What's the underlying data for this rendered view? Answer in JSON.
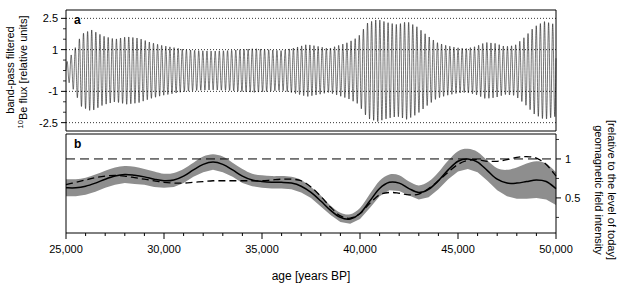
{
  "figure": {
    "width": 620,
    "height": 286,
    "background": "#ffffff",
    "band_color": "#8e8e8e",
    "line_color": "#000000"
  },
  "panel_a": {
    "label": "a",
    "axis_title_line1": "band-pass filtered",
    "axis_title_line2_pre": "10",
    "axis_title_line2": "Be flux [relative units]",
    "y_ticks": [
      "2.5",
      "1",
      "-1",
      "-2.5"
    ],
    "y_tick_values": [
      2.5,
      1,
      -1,
      -2.5
    ],
    "ylim": [
      -2.9,
      2.9
    ],
    "reference_lines": [
      2.5,
      1,
      -1,
      -2.5
    ],
    "reference_line_style": "dotted"
  },
  "panel_b": {
    "label": "b",
    "axis_title_line1": "geomagnetic field intensity",
    "axis_title_line2": "[relative to the level of today]",
    "y_ticks": [
      "1",
      "0.5"
    ],
    "y_tick_values": [
      1,
      0.5
    ],
    "ylim": [
      0.05,
      1.32
    ],
    "reference_lines": [
      1
    ],
    "reference_line_style": "dashed"
  },
  "x_axis": {
    "title": "age [years BP]",
    "tick_labels": [
      "25,000",
      "30,000",
      "35,000",
      "40,000",
      "45,000",
      "50,000"
    ],
    "tick_values": [
      25000,
      30000,
      35000,
      40000,
      45000,
      50000
    ],
    "minor_tick_step": 1000,
    "xlim": [
      25000,
      50000
    ]
  },
  "chart_data": {
    "type": "line",
    "title": "",
    "xlabel": "age [years BP]",
    "xlim": [
      25000,
      50000
    ],
    "grid": false,
    "legend": "none",
    "panels": [
      {
        "id": "a",
        "label": "a",
        "type": "line",
        "ylabel": "band-pass filtered 10Be flux [relative units]",
        "ylim": [
          -2.9,
          2.9
        ],
        "yticks": [
          2.5,
          1,
          -1,
          -2.5
        ],
        "description": "Band-pass filtered 10Be flux: high-frequency oscillation (~ 210 yr period) with amplitude modulation envelope.",
        "oscillation_period_years": 210,
        "series": [
          {
            "name": "band-pass filtered 10Be flux envelope",
            "x": [
              25000,
              25400,
              25800,
              26300,
              26900,
              27500,
              28100,
              28700,
              29300,
              29900,
              30500,
              31100,
              31800,
              32500,
              33200,
              33900,
              34600,
              35300,
              36000,
              36700,
              37300,
              37900,
              38400,
              38900,
              39400,
              39900,
              40400,
              40900,
              41400,
              41900,
              42400,
              42900,
              43400,
              43900,
              44400,
              44900,
              45400,
              45900,
              46400,
              46900,
              47400,
              47900,
              48400,
              48900,
              49400,
              50000
            ],
            "values": [
              0.35,
              0.95,
              1.75,
              1.95,
              1.65,
              1.5,
              1.62,
              1.55,
              1.35,
              1.2,
              1.1,
              1.0,
              0.95,
              0.93,
              0.95,
              1.0,
              1.05,
              1.0,
              0.95,
              1.1,
              1.25,
              1.15,
              1.05,
              1.2,
              1.35,
              1.6,
              2.3,
              2.45,
              2.3,
              2.2,
              2.35,
              2.1,
              1.7,
              1.35,
              1.2,
              1.1,
              1.05,
              1.15,
              1.35,
              1.3,
              1.15,
              1.2,
              1.6,
              2.1,
              2.35,
              2.2
            ]
          }
        ]
      },
      {
        "id": "b",
        "label": "b",
        "type": "line",
        "ylabel": "geomagnetic field intensity [relative to the level of today]",
        "ylim": [
          0.05,
          1.32
        ],
        "yticks": [
          1,
          0.5
        ],
        "reference_line": 1,
        "series": [
          {
            "name": "reconstruction (solid)",
            "style": "solid",
            "x": [
              25000,
              25500,
              26000,
              26500,
              27000,
              27500,
              28000,
              28500,
              29000,
              29500,
              30000,
              30500,
              31000,
              31500,
              32000,
              32500,
              33000,
              33500,
              34000,
              34500,
              35000,
              35500,
              36000,
              36500,
              37000,
              37500,
              38000,
              38500,
              39000,
              39500,
              40000,
              40500,
              41000,
              41500,
              42000,
              42500,
              43000,
              43500,
              44000,
              44500,
              45000,
              45500,
              46000,
              46500,
              47000,
              47500,
              48000,
              48500,
              49000,
              49500,
              50000
            ],
            "values": [
              0.63,
              0.63,
              0.65,
              0.69,
              0.74,
              0.78,
              0.8,
              0.79,
              0.77,
              0.74,
              0.72,
              0.73,
              0.78,
              0.86,
              0.93,
              0.96,
              0.93,
              0.86,
              0.78,
              0.73,
              0.71,
              0.7,
              0.7,
              0.69,
              0.65,
              0.57,
              0.46,
              0.34,
              0.25,
              0.23,
              0.3,
              0.46,
              0.62,
              0.7,
              0.69,
              0.62,
              0.57,
              0.61,
              0.72,
              0.86,
              0.97,
              1.0,
              0.96,
              0.85,
              0.74,
              0.69,
              0.69,
              0.71,
              0.73,
              0.71,
              0.62
            ]
          },
          {
            "name": "comparison record (dashed)",
            "style": "dashed",
            "x": [
              25000,
              25500,
              26000,
              26500,
              27000,
              27500,
              28000,
              28500,
              29000,
              29500,
              30000,
              30500,
              31000,
              31500,
              32000,
              32500,
              33000,
              33500,
              34000,
              34500,
              35000,
              35500,
              36000,
              36500,
              37000,
              37500,
              38000,
              38500,
              39000,
              39500,
              40000,
              40500,
              41000,
              41500,
              42000,
              42500,
              43000,
              43500,
              44000,
              44500,
              45000,
              45500,
              46000,
              46500,
              47000,
              47500,
              48000,
              48500,
              49000,
              49500,
              50000
            ],
            "values": [
              0.67,
              0.7,
              0.73,
              0.76,
              0.78,
              0.79,
              0.78,
              0.76,
              0.74,
              0.72,
              0.7,
              0.69,
              0.69,
              0.7,
              0.71,
              0.72,
              0.72,
              0.72,
              0.72,
              0.72,
              0.72,
              0.73,
              0.74,
              0.74,
              0.72,
              0.64,
              0.52,
              0.38,
              0.27,
              0.24,
              0.3,
              0.43,
              0.54,
              0.57,
              0.56,
              0.54,
              0.55,
              0.62,
              0.72,
              0.83,
              0.93,
              0.98,
              0.99,
              0.97,
              0.97,
              0.99,
              1.02,
              1.03,
              1.01,
              0.93,
              0.78
            ]
          },
          {
            "name": "uncertainty band upper",
            "style": "band",
            "x": [
              25000,
              25500,
              26000,
              26500,
              27000,
              27500,
              28000,
              28500,
              29000,
              29500,
              30000,
              30500,
              31000,
              31500,
              32000,
              32500,
              33000,
              33500,
              34000,
              34500,
              35000,
              35500,
              36000,
              36500,
              37000,
              37500,
              38000,
              38500,
              39000,
              39500,
              40000,
              40500,
              41000,
              41500,
              42000,
              42500,
              43000,
              43500,
              44000,
              44500,
              45000,
              45500,
              46000,
              46500,
              47000,
              47500,
              48000,
              48500,
              49000,
              49500,
              50000
            ],
            "values": [
              0.74,
              0.74,
              0.76,
              0.8,
              0.85,
              0.89,
              0.91,
              0.9,
              0.87,
              0.84,
              0.81,
              0.82,
              0.87,
              0.95,
              1.03,
              1.06,
              1.03,
              0.95,
              0.87,
              0.81,
              0.79,
              0.78,
              0.78,
              0.77,
              0.73,
              0.64,
              0.53,
              0.4,
              0.31,
              0.29,
              0.37,
              0.55,
              0.72,
              0.8,
              0.79,
              0.71,
              0.66,
              0.71,
              0.83,
              0.98,
              1.1,
              1.13,
              1.09,
              0.98,
              0.88,
              0.86,
              0.89,
              0.94,
              0.97,
              0.94,
              0.83
            ]
          },
          {
            "name": "uncertainty band lower",
            "style": "band",
            "x": [
              25000,
              25500,
              26000,
              26500,
              27000,
              27500,
              28000,
              28500,
              29000,
              29500,
              30000,
              30500,
              31000,
              31500,
              32000,
              32500,
              33000,
              33500,
              34000,
              34500,
              35000,
              35500,
              36000,
              36500,
              37000,
              37500,
              38000,
              38500,
              39000,
              39500,
              40000,
              40500,
              41000,
              41500,
              42000,
              42500,
              43000,
              43500,
              44000,
              44500,
              45000,
              45500,
              46000,
              46500,
              47000,
              47500,
              48000,
              48500,
              49000,
              49500,
              50000
            ],
            "values": [
              0.52,
              0.52,
              0.54,
              0.58,
              0.63,
              0.67,
              0.69,
              0.68,
              0.67,
              0.64,
              0.63,
              0.64,
              0.69,
              0.77,
              0.83,
              0.86,
              0.83,
              0.77,
              0.69,
              0.65,
              0.63,
              0.62,
              0.62,
              0.61,
              0.57,
              0.5,
              0.39,
              0.28,
              0.19,
              0.17,
              0.23,
              0.37,
              0.52,
              0.6,
              0.59,
              0.53,
              0.48,
              0.51,
              0.61,
              0.74,
              0.84,
              0.87,
              0.83,
              0.72,
              0.6,
              0.52,
              0.49,
              0.49,
              0.5,
              0.48,
              0.41
            ]
          }
        ]
      }
    ]
  }
}
